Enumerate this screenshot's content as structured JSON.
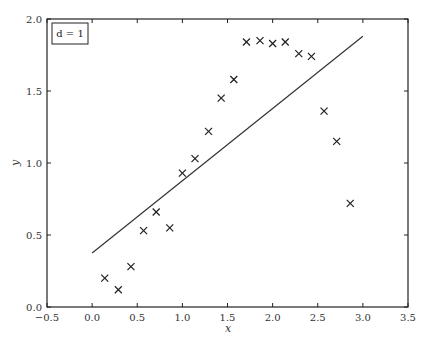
{
  "chart_data": {
    "type": "scatter",
    "title": "",
    "xlabel": "x",
    "ylabel": "y",
    "xlim": [
      -0.5,
      3.5
    ],
    "ylim": [
      0.0,
      2.0
    ],
    "grid": false,
    "xticks": [
      "−0.5",
      "0.0",
      "0.5",
      "1.0",
      "1.5",
      "2.0",
      "2.5",
      "3.0",
      "3.5"
    ],
    "yticks": [
      "0.0",
      "0.5",
      "1.0",
      "1.5",
      "2.0"
    ],
    "annotation": "d = 1",
    "series": [
      {
        "name": "data",
        "marker": "x",
        "x": [
          0.14,
          0.29,
          0.43,
          0.57,
          0.71,
          0.86,
          1.0,
          1.14,
          1.29,
          1.43,
          1.57,
          1.71,
          1.86,
          2.0,
          2.14,
          2.29,
          2.43,
          2.57,
          2.71,
          2.86
        ],
        "y": [
          0.2,
          0.12,
          0.28,
          0.53,
          0.66,
          0.55,
          0.93,
          1.03,
          1.22,
          1.45,
          1.58,
          1.84,
          1.85,
          1.83,
          1.84,
          1.76,
          1.74,
          1.36,
          1.15,
          0.72
        ]
      },
      {
        "name": "degree-1 fit",
        "type": "line",
        "x": [
          0.0,
          3.0
        ],
        "y": [
          0.375,
          1.88
        ]
      }
    ]
  }
}
